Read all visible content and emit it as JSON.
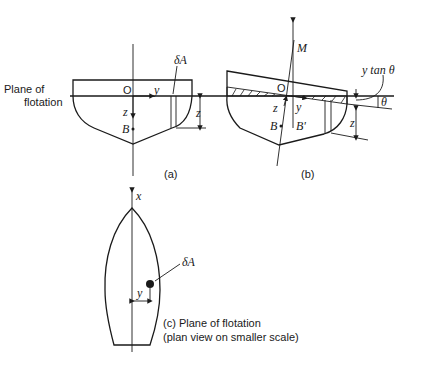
{
  "figure": {
    "a": {
      "caption": "(a)",
      "plane_label_line1": "Plane of",
      "plane_label_line2": "flotation",
      "origin": "O",
      "y_axis": "y",
      "z_axis": "z",
      "buoyancy_centre": "B",
      "element": "δA",
      "depth": "z"
    },
    "b": {
      "caption": "(b)",
      "metacentre": "M",
      "origin": "O",
      "y_axis": "y",
      "z_axis": "z",
      "buoyancy_centre": "B",
      "shifted_buoyancy_centre": "B'",
      "wedge_label": "y tan θ",
      "angle": "θ",
      "depth": "z"
    },
    "c": {
      "x_axis": "x",
      "element": "δA",
      "y_axis": "y",
      "caption_line1": "(c) Plane of flotation",
      "caption_line2": "(plan view on smaller scale)"
    }
  }
}
